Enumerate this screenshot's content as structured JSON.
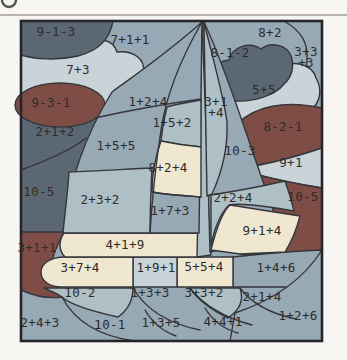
{
  "page": {
    "background": "#f8f6f2",
    "rule_color": "#b7b2aa",
    "badge_color": "#55534e"
  },
  "puzzle": {
    "border_color": "#26262a",
    "outline_color": "#35363b",
    "text_color": "#2e2c29",
    "palette": {
      "darkSlate": "#5b6874",
      "darkRed": "#7e4e46",
      "blueMed": "#97a9b4",
      "blueSoft": "#aebfc6",
      "blueLight": "#c9d4d8",
      "cream": "#efe7d0"
    },
    "regions": [
      {
        "label": "9-1-3",
        "x": 56,
        "y": 32,
        "color": "darkSlate"
      },
      {
        "label": "7+1+1",
        "x": 130,
        "y": 40,
        "color": "blueMed"
      },
      {
        "label": "8+2",
        "x": 270,
        "y": 33,
        "color": "blueMed"
      },
      {
        "label": "3+3",
        "label2": "+3",
        "x": 306,
        "y": 52,
        "color": "blueMed"
      },
      {
        "label": "8-1-2",
        "x": 230,
        "y": 53,
        "color": "darkSlate"
      },
      {
        "label": "7+3",
        "x": 78,
        "y": 70,
        "color": "blueLight"
      },
      {
        "label": "5+5",
        "x": 264,
        "y": 90,
        "color": "blueLight"
      },
      {
        "label": "9-3-1",
        "x": 51,
        "y": 103,
        "color": "darkRed"
      },
      {
        "label": "3+1",
        "label2": "+4",
        "x": 216,
        "y": 102,
        "color": "blueSoft"
      },
      {
        "label": "1+2+4",
        "x": 148,
        "y": 102,
        "color": "blueMed"
      },
      {
        "label": "1+5+2",
        "x": 172,
        "y": 123,
        "color": "blueSoft"
      },
      {
        "label": "8-2-1",
        "x": 283,
        "y": 127,
        "color": "darkRed"
      },
      {
        "label": "2+1+2",
        "x": 55,
        "y": 132,
        "color": "darkSlate"
      },
      {
        "label": "1+5+5",
        "x": 116,
        "y": 146,
        "color": "blueMed"
      },
      {
        "label": "10-3",
        "x": 240,
        "y": 151,
        "color": "blueMed"
      },
      {
        "label": "9+1",
        "x": 291,
        "y": 163,
        "color": "blueLight"
      },
      {
        "label": "8+2+4",
        "x": 168,
        "y": 168,
        "color": "cream"
      },
      {
        "label": "10-5",
        "x": 39,
        "y": 192,
        "color": "darkSlate"
      },
      {
        "label": "10-5",
        "x": 303,
        "y": 197,
        "color": "darkRed"
      },
      {
        "label": "2+3+2",
        "x": 100,
        "y": 200,
        "color": "blueSoft"
      },
      {
        "label": "2+2+4",
        "x": 233,
        "y": 198,
        "color": "blueSoft"
      },
      {
        "label": "1+7+3",
        "x": 170,
        "y": 211,
        "color": "blueMed"
      },
      {
        "label": "9+1+4",
        "x": 262,
        "y": 231,
        "color": "cream"
      },
      {
        "label": "4+1+9",
        "x": 125,
        "y": 245,
        "color": "cream"
      },
      {
        "label": "3+1+1",
        "x": 37,
        "y": 248,
        "color": "darkRed"
      },
      {
        "label": "3+7+4",
        "x": 80,
        "y": 268,
        "color": "cream"
      },
      {
        "label": "1+9+1",
        "x": 156,
        "y": 268,
        "color": "blueLight"
      },
      {
        "label": "5+5+4",
        "x": 204,
        "y": 267,
        "color": "cream"
      },
      {
        "label": "1+4+6",
        "x": 276,
        "y": 268,
        "color": "blueMed"
      },
      {
        "label": "10-2",
        "x": 80,
        "y": 293,
        "color": "blueSoft"
      },
      {
        "label": "1+3+3",
        "x": 150,
        "y": 293,
        "color": "blueMed"
      },
      {
        "label": "3+3+2",
        "x": 204,
        "y": 293,
        "color": "blueSoft"
      },
      {
        "label": "2+1+4",
        "x": 262,
        "y": 297,
        "color": "blueMed"
      },
      {
        "label": "2+4+3",
        "x": 40,
        "y": 323,
        "color": "blueMed"
      },
      {
        "label": "10-1",
        "x": 110,
        "y": 325,
        "color": "blueMed"
      },
      {
        "label": "1+3+5",
        "x": 161,
        "y": 323,
        "color": "blueMed"
      },
      {
        "label": "4+4+1",
        "x": 223,
        "y": 322,
        "color": "blueMed"
      },
      {
        "label": "1+2+6",
        "x": 298,
        "y": 316,
        "color": "blueMed"
      }
    ]
  }
}
